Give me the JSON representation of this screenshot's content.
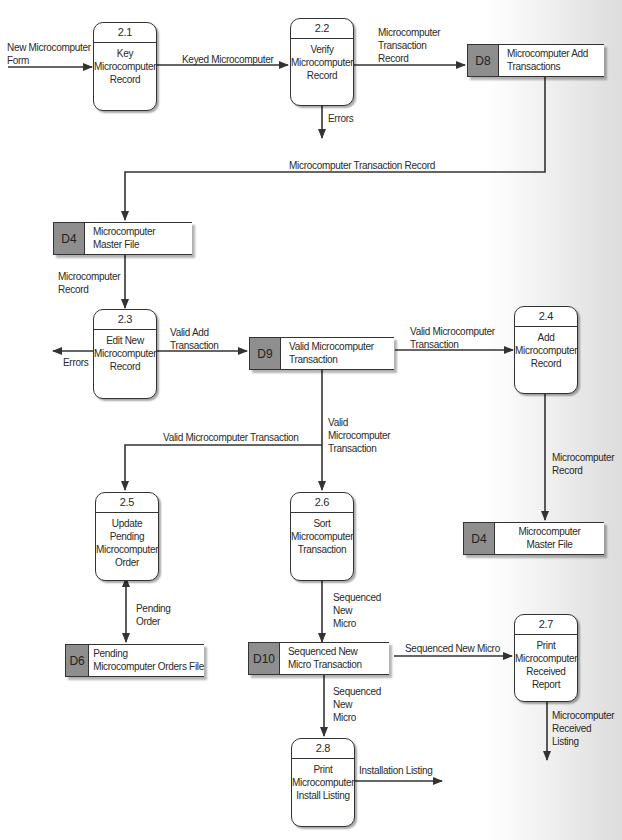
{
  "processes": [
    {
      "id": "2.1",
      "name": "Key\nMicrocomputer\nRecord"
    },
    {
      "id": "2.2",
      "name": "Verify\nMicrocomputer\nRecord"
    },
    {
      "id": "2.3",
      "name": "Edit New\nMicrocomputer\nRecord"
    },
    {
      "id": "2.4",
      "name": "Add\nMicrocomputer\nRecord"
    },
    {
      "id": "2.5",
      "name": "Update\nPending\nMicrocomputer\nOrder"
    },
    {
      "id": "2.6",
      "name": "Sort\nMicrocomputer\nTransaction"
    },
    {
      "id": "2.7",
      "name": "Print\nMicrocomputer\nReceived\nReport"
    },
    {
      "id": "2.8",
      "name": "Print\nMicrocomputer\nInstall Listing"
    }
  ],
  "data_stores": [
    {
      "id": "D8",
      "name": "Microcomputer Add\nTransactions"
    },
    {
      "id": "D4",
      "name": "Microcomputer\nMaster File"
    },
    {
      "id": "D9",
      "name": "Valid Microcomputer\nTransaction"
    },
    {
      "id": "D4",
      "name": "Microcomputer\nMaster File"
    },
    {
      "id": "D6",
      "name": "Pending\nMicrocomputer Orders File"
    },
    {
      "id": "D10",
      "name": "Sequenced New\nMicro Transaction"
    }
  ],
  "flows": [
    {
      "label": "New Microcomputer\nForm"
    },
    {
      "label": "Keyed Microcomputer"
    },
    {
      "label": "Microcomputer\nTransaction\nRecord"
    },
    {
      "label": "Errors"
    },
    {
      "label": "Microcomputer Transaction Record"
    },
    {
      "label": "Microcomputer\nRecord"
    },
    {
      "label": "Valid Add\nTransaction"
    },
    {
      "label": "Errors"
    },
    {
      "label": "Valid Microcomputer\nTransaction"
    },
    {
      "label": "Valid\nMicrocomputer\nTransaction"
    },
    {
      "label": "Valid Microcomputer Transaction"
    },
    {
      "label": "Microcomputer\nRecord"
    },
    {
      "label": "Pending\nOrder"
    },
    {
      "label": "Sequenced\nNew\nMicro"
    },
    {
      "label": "Sequenced New Micro"
    },
    {
      "label": "Sequenced\nNew\nMicro"
    },
    {
      "label": "Microcomputer\nReceived\nListing"
    },
    {
      "label": "Installation Listing"
    }
  ]
}
